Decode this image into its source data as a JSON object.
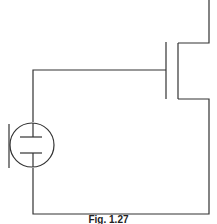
{
  "figure": {
    "caption": "Fig. 1.27",
    "line_color": "#333333",
    "components": [
      {
        "type": "ac-voltage-source",
        "label": ""
      },
      {
        "type": "mosfet",
        "label": ""
      }
    ]
  }
}
